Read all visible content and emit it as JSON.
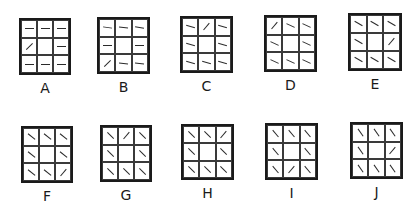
{
  "figure": {
    "panels": [
      {
        "label": "A",
        "x": 19,
        "y": 18,
        "w": 52,
        "h": 57,
        "cells": [
          [
            0,
            0,
            0
          ],
          [
            -45,
            null,
            0
          ],
          [
            0,
            0,
            0
          ]
        ]
      },
      {
        "label": "B",
        "x": 97,
        "y": 17,
        "w": 53,
        "h": 57,
        "cells": [
          [
            8,
            5,
            10
          ],
          [
            0,
            null,
            0
          ],
          [
            -45,
            5,
            5
          ]
        ]
      },
      {
        "label": "C",
        "x": 180,
        "y": 16,
        "w": 53,
        "h": 57,
        "cells": [
          [
            15,
            -50,
            15
          ],
          [
            15,
            null,
            15
          ],
          [
            15,
            15,
            15
          ]
        ]
      },
      {
        "label": "D",
        "x": 264,
        "y": 15,
        "w": 53,
        "h": 57,
        "cells": [
          [
            -50,
            25,
            25
          ],
          [
            25,
            null,
            25
          ],
          [
            25,
            25,
            25
          ]
        ]
      },
      {
        "label": "E",
        "x": 348,
        "y": 13,
        "w": 54,
        "h": 58,
        "cells": [
          [
            30,
            30,
            30
          ],
          [
            30,
            null,
            -50
          ],
          [
            30,
            30,
            30
          ]
        ]
      },
      {
        "label": "F",
        "x": 21,
        "y": 126,
        "w": 52,
        "h": 57,
        "cells": [
          [
            38,
            38,
            38
          ],
          [
            38,
            null,
            38
          ],
          [
            38,
            38,
            -50
          ]
        ]
      },
      {
        "label": "G",
        "x": 100,
        "y": 125,
        "w": 52,
        "h": 57,
        "cells": [
          [
            45,
            -50,
            45
          ],
          [
            45,
            null,
            45
          ],
          [
            45,
            45,
            45
          ]
        ]
      },
      {
        "label": "H",
        "x": 181,
        "y": 124,
        "w": 53,
        "h": 56,
        "cells": [
          [
            45,
            45,
            -50
          ],
          [
            45,
            null,
            45
          ],
          [
            45,
            45,
            45
          ]
        ]
      },
      {
        "label": "I",
        "x": 265,
        "y": 123,
        "w": 53,
        "h": 57,
        "cells": [
          [
            50,
            50,
            50
          ],
          [
            50,
            null,
            50
          ],
          [
            50,
            -50,
            50
          ]
        ]
      },
      {
        "label": "J",
        "x": 350,
        "y": 122,
        "w": 53,
        "h": 57,
        "cells": [
          [
            55,
            55,
            55
          ],
          [
            55,
            null,
            -50
          ],
          [
            55,
            55,
            55
          ]
        ]
      }
    ]
  }
}
